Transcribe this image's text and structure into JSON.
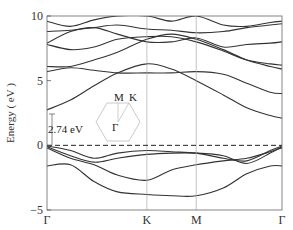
{
  "chart_data": {
    "type": "line",
    "title": "",
    "xlabel": "",
    "ylabel": "Energy ( eV )",
    "ylim": [
      -5,
      10
    ],
    "yticks": [
      -5,
      0,
      5,
      10
    ],
    "xticks": [
      {
        "label": "Γ",
        "pos": 0.0
      },
      {
        "label": "K",
        "pos": 0.425
      },
      {
        "label": "M",
        "pos": 0.635
      },
      {
        "label": "Γ",
        "pos": 1.0
      }
    ],
    "fermi_level": 0,
    "grid": false,
    "annotations": [
      {
        "text": "2.74 eV",
        "meaning": "band gap at Γ"
      },
      {
        "text": "M",
        "meaning": "BZ inset label"
      },
      {
        "text": "K",
        "meaning": "BZ inset label"
      },
      {
        "text": "Γ",
        "meaning": "BZ inset label"
      }
    ],
    "x": [
      0.0,
      0.1,
      0.2,
      0.3,
      0.425,
      0.53,
      0.635,
      0.75,
      0.85,
      0.95,
      1.0
    ],
    "series": [
      {
        "name": "valence-4",
        "values": [
          -1.6,
          -1.5,
          -2.8,
          -3.6,
          -3.8,
          -3.9,
          -3.9,
          -3.3,
          -2.2,
          -1.6,
          -1.6
        ]
      },
      {
        "name": "valence-3",
        "values": [
          -0.2,
          -1.0,
          -1.5,
          -2.3,
          -2.7,
          -1.9,
          -1.5,
          -1.2,
          -1.0,
          -0.5,
          -0.2
        ]
      },
      {
        "name": "valence-2",
        "values": [
          -0.1,
          -0.8,
          -1.3,
          -1.0,
          -0.7,
          -0.6,
          -0.6,
          -0.8,
          -1.4,
          -0.6,
          -0.1
        ]
      },
      {
        "name": "valence-1",
        "values": [
          -0.05,
          -0.4,
          -1.0,
          -0.6,
          -0.4,
          -0.5,
          -0.6,
          -1.0,
          -1.2,
          -0.4,
          -0.05
        ]
      },
      {
        "name": "conduction-1",
        "values": [
          2.74,
          3.5,
          4.6,
          5.6,
          6.3,
          5.9,
          5.0,
          3.9,
          2.9,
          2.3,
          2.1
        ]
      },
      {
        "name": "conduction-2",
        "values": [
          5.7,
          6.0,
          5.8,
          5.6,
          5.6,
          5.6,
          5.7,
          5.5,
          4.8,
          4.1,
          4.0
        ]
      },
      {
        "name": "conduction-3",
        "values": [
          6.1,
          6.1,
          6.6,
          7.2,
          8.2,
          8.6,
          8.2,
          7.4,
          6.6,
          6.1,
          5.9
        ]
      },
      {
        "name": "conduction-4",
        "values": [
          7.8,
          7.4,
          7.6,
          8.2,
          8.4,
          8.4,
          8.0,
          7.3,
          6.6,
          6.3,
          6.2
        ]
      },
      {
        "name": "conduction-5",
        "values": [
          7.9,
          8.8,
          9.1,
          8.6,
          8.0,
          8.0,
          8.3,
          7.6,
          7.8,
          7.9,
          8.0
        ]
      },
      {
        "name": "conduction-6",
        "values": [
          8.8,
          8.9,
          9.1,
          9.3,
          9.0,
          8.9,
          8.7,
          8.8,
          9.1,
          9.3,
          9.4
        ]
      },
      {
        "name": "conduction-7",
        "values": [
          9.6,
          9.2,
          9.7,
          10.0,
          10.0,
          9.6,
          10.0,
          9.3,
          9.2,
          9.5,
          9.6
        ]
      }
    ]
  },
  "labels": {
    "ylabel": "Energy ( eV )",
    "gap": "2.74 eV",
    "inset_M": "M",
    "inset_K": "K",
    "inset_G": "Γ"
  }
}
